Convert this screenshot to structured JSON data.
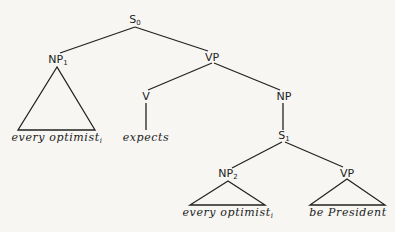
{
  "diagram": {
    "type": "syntax-tree",
    "nodes": {
      "s0": {
        "label": "S",
        "sub": "0"
      },
      "np1": {
        "label": "NP",
        "sub": "1"
      },
      "vp": {
        "label": "VP",
        "sub": ""
      },
      "v": {
        "label": "V",
        "sub": ""
      },
      "np": {
        "label": "NP",
        "sub": ""
      },
      "s1": {
        "label": "S",
        "sub": "1"
      },
      "np2": {
        "label": "NP",
        "sub": "2"
      },
      "vp2": {
        "label": "VP",
        "sub": ""
      }
    },
    "leaves": {
      "np1_leaf": {
        "text": "every optimist",
        "sub": "i"
      },
      "v_leaf": {
        "text": "expects",
        "sub": ""
      },
      "np2_leaf": {
        "text": "every optimist",
        "sub": "i"
      },
      "vp2_leaf": {
        "text": "be President",
        "sub": ""
      }
    },
    "edges": [
      [
        "S0",
        "NP1"
      ],
      [
        "S0",
        "VP"
      ],
      [
        "VP",
        "V"
      ],
      [
        "VP",
        "NP"
      ],
      [
        "NP",
        "S1"
      ],
      [
        "S1",
        "NP2"
      ],
      [
        "S1",
        "VP"
      ],
      [
        "V",
        "expects"
      ]
    ],
    "triangles": [
      "NP1",
      "NP2",
      "VP (lower)"
    ]
  }
}
